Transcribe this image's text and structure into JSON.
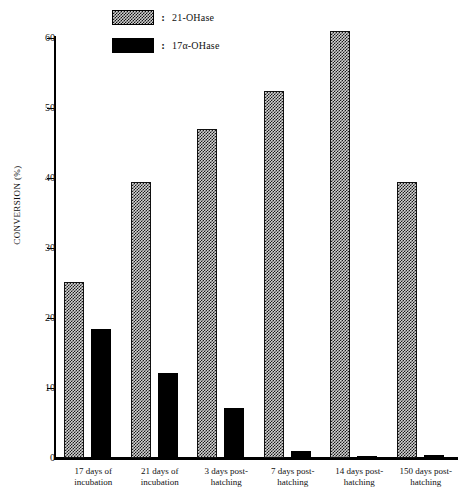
{
  "chart_data": {
    "type": "bar",
    "title": "",
    "xlabel": "",
    "ylabel": "CONVERSION (%)",
    "ylim": [
      0,
      62
    ],
    "yticks": [
      "0",
      "10",
      "20",
      "30",
      "40",
      "50",
      "60"
    ],
    "grid": false,
    "legend_position": "top-left",
    "categories": [
      "17 days of\nincubation",
      "21 days of\nincubation",
      "3 days post-\nhatching",
      "7 days post-\nhatching",
      "14 days post-\nhatching",
      "150 days post-\nhatching"
    ],
    "series": [
      {
        "name": "21-OHase",
        "pattern": "checkered-hatch",
        "values": [
          25.2,
          39.5,
          47.0,
          52.5,
          61.0,
          39.5
        ]
      },
      {
        "name": "17α-OHase",
        "pattern": "solid-black",
        "values": [
          18.5,
          12.1,
          7.2,
          1.0,
          0.3,
          0.4
        ]
      }
    ]
  },
  "legend": {
    "separator": ":",
    "items": [
      {
        "label": "21-OHase",
        "swatch": "hatch-swatch"
      },
      {
        "label": "17α-OHase",
        "swatch": "solid-swatch"
      }
    ]
  }
}
